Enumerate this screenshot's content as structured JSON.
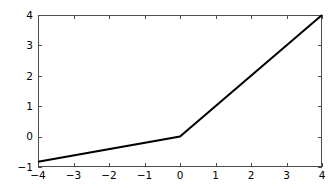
{
  "figure": {
    "background_color": "#ffffff",
    "axes_background_color": "#ffffff",
    "frame_color": "#4d4d4d",
    "tick_color": "#4d4d4d",
    "tick_label_color": "#000000"
  },
  "chart_data": {
    "type": "line",
    "title": "",
    "subtitle": "",
    "xlabel": "",
    "ylabel": "",
    "xlim": [
      -4,
      4
    ],
    "ylim": [
      -1,
      4
    ],
    "grid": false,
    "legend": null,
    "legend_position": "none",
    "xticks": [
      -4,
      -3,
      -2,
      -1,
      0,
      1,
      2,
      3,
      4
    ],
    "xtick_labels": [
      "-4",
      "-3",
      "-2",
      "-1",
      "0",
      "1",
      "2",
      "3",
      "4"
    ],
    "yticks": [
      -1,
      0,
      1,
      2,
      3,
      4
    ],
    "ytick_labels": [
      "-1",
      "0",
      "1",
      "2",
      "3",
      "4"
    ],
    "tick_direction": "in",
    "series": [
      {
        "name": "leaky-relu",
        "color": "#000000",
        "line_width": 2.0,
        "x": [
          -4,
          0,
          4
        ],
        "y": [
          -0.83,
          0,
          4
        ]
      }
    ],
    "annotations": []
  }
}
